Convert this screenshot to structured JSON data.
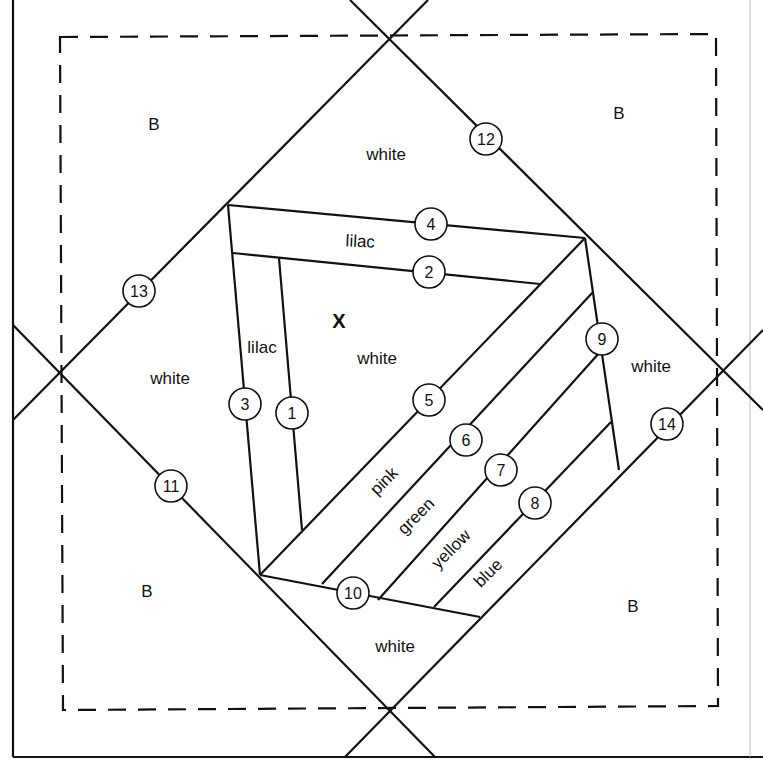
{
  "diagram": {
    "type": "foundation paper piecing quilt block pattern",
    "colors": {
      "line": "#111111",
      "background": "#ffffff"
    },
    "corner_labels": [
      {
        "id": "corner-top-left",
        "text": "B",
        "x": 154,
        "y": 130
      },
      {
        "id": "corner-top-right",
        "text": "B",
        "x": 619,
        "y": 119
      },
      {
        "id": "corner-bottom-left",
        "text": "B",
        "x": 147,
        "y": 597
      },
      {
        "id": "corner-bottom-right",
        "text": "B",
        "x": 633,
        "y": 612
      }
    ],
    "fabric_labels": [
      {
        "id": "white-top",
        "text": "white",
        "x": 386,
        "y": 160,
        "rotate": 0
      },
      {
        "id": "white-left",
        "text": "white",
        "x": 170,
        "y": 384,
        "rotate": 0
      },
      {
        "id": "white-right",
        "text": "white",
        "x": 651,
        "y": 372,
        "rotate": 0
      },
      {
        "id": "white-bottom",
        "text": "white",
        "x": 395,
        "y": 652,
        "rotate": 0
      },
      {
        "id": "white-center",
        "text": "white",
        "x": 377,
        "y": 364,
        "rotate": 0
      },
      {
        "id": "lilac-horizontal",
        "text": "lilac",
        "x": 360,
        "y": 247,
        "rotate": 4
      },
      {
        "id": "lilac-vertical",
        "text": "lilac",
        "x": 262,
        "y": 353,
        "rotate": 0
      },
      {
        "id": "pink-strip",
        "text": "pink",
        "x": 388,
        "y": 485,
        "rotate": -45
      },
      {
        "id": "green-strip",
        "text": "green",
        "x": 420,
        "y": 520,
        "rotate": -45
      },
      {
        "id": "yellow-strip",
        "text": "yellow",
        "x": 455,
        "y": 553,
        "rotate": -45
      },
      {
        "id": "blue-strip",
        "text": "blue",
        "x": 492,
        "y": 577,
        "rotate": -45
      }
    ],
    "center_marker": {
      "text": "X",
      "x": 339,
      "y": 327
    },
    "piece_numbers": [
      {
        "n": "1",
        "x": 292,
        "y": 413
      },
      {
        "n": "2",
        "x": 429,
        "y": 272
      },
      {
        "n": "3",
        "x": 245,
        "y": 404
      },
      {
        "n": "4",
        "x": 431,
        "y": 224
      },
      {
        "n": "5",
        "x": 429,
        "y": 400
      },
      {
        "n": "6",
        "x": 466,
        "y": 440
      },
      {
        "n": "7",
        "x": 501,
        "y": 470
      },
      {
        "n": "8",
        "x": 535,
        "y": 503
      },
      {
        "n": "9",
        "x": 602,
        "y": 339
      },
      {
        "n": "10",
        "x": 353,
        "y": 593
      },
      {
        "n": "11",
        "x": 171,
        "y": 486
      },
      {
        "n": "12",
        "x": 486,
        "y": 139
      },
      {
        "n": "13",
        "x": 139,
        "y": 291
      },
      {
        "n": "14",
        "x": 667,
        "y": 424
      }
    ]
  }
}
